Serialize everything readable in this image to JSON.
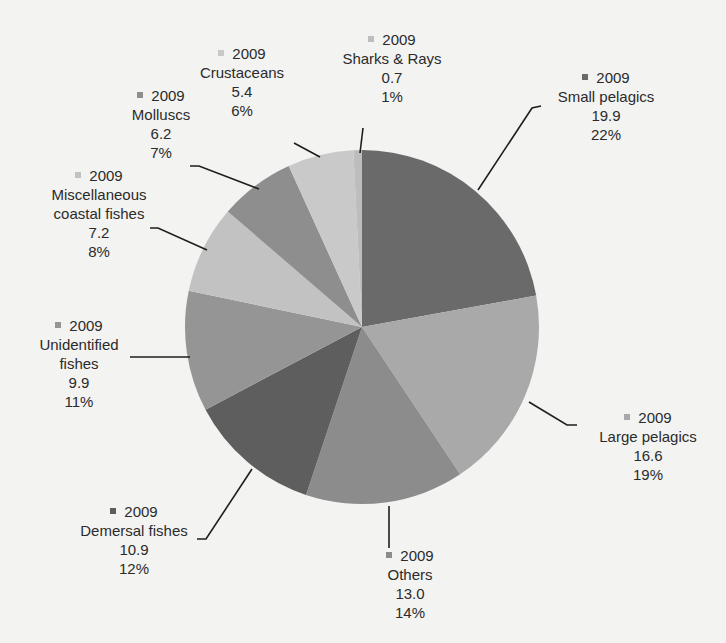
{
  "chart_data": {
    "type": "pie",
    "title": "",
    "start_angle_deg": 0,
    "direction": "clockwise",
    "series_label": "2009",
    "categories": [
      "Small pelagics",
      "Large pelagics",
      "Others",
      "Demersal fishes",
      "Unidentified fishes",
      "Miscellaneous coastal fishes",
      "Molluscs",
      "Crustaceans",
      "Sharks & Rays"
    ],
    "values": [
      19.9,
      16.6,
      13.0,
      10.9,
      9.9,
      7.2,
      6.2,
      5.4,
      0.7
    ],
    "percentages": [
      "22%",
      "19%",
      "14%",
      "12%",
      "11%",
      "8%",
      "7%",
      "6%",
      "1%"
    ],
    "colors": [
      "#6a6a6a",
      "#a9a9a9",
      "#8c8c8c",
      "#5e5e5e",
      "#959595",
      "#c2c2c2",
      "#8e8e8e",
      "#c9c9c9",
      "#bdbdbd"
    ],
    "legend": "inline labels with leader lines"
  },
  "labels": [
    {
      "year": "2009",
      "name": "Small pelagics",
      "value": "19.9",
      "pct": "22%"
    },
    {
      "year": "2009",
      "name": "Large pelagics",
      "value": "16.6",
      "pct": "19%"
    },
    {
      "year": "2009",
      "name": "Others",
      "value": "13.0",
      "pct": "14%"
    },
    {
      "year": "2009",
      "name": "Demersal fishes",
      "value": "10.9",
      "pct": "12%"
    },
    {
      "year": "2009",
      "name": "Unidentified",
      "name2": "fishes",
      "value": "9.9",
      "pct": "11%"
    },
    {
      "year": "2009",
      "name": "Miscellaneous",
      "name2": "coastal fishes",
      "value": "7.2",
      "pct": "8%"
    },
    {
      "year": "2009",
      "name": "Molluscs",
      "value": "6.2",
      "pct": "7%"
    },
    {
      "year": "2009",
      "name": "Crustaceans",
      "value": "5.4",
      "pct": "6%"
    },
    {
      "year": "2009",
      "name": "Sharks & Rays",
      "value": "0.7",
      "pct": "1%"
    }
  ]
}
